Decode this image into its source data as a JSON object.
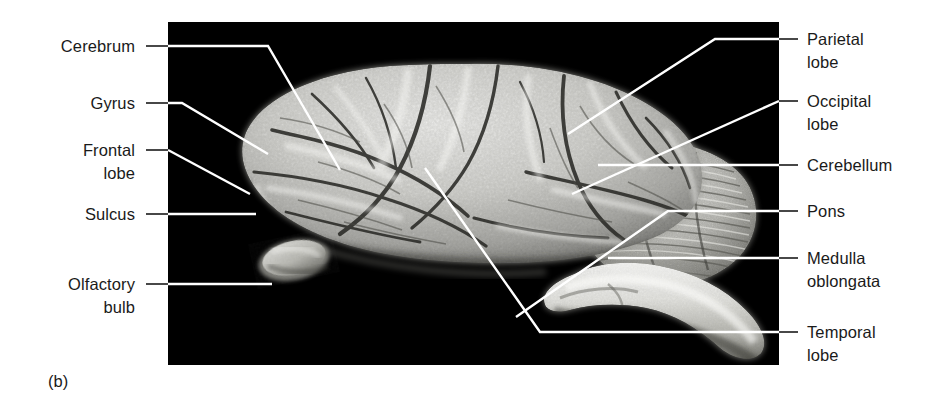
{
  "figure": {
    "caption": "(b)",
    "plate_background": "#000000",
    "label_color": "#1a1a1a",
    "leader_color_on_black": "#ffffff",
    "leader_color_on_white": "#1a1a1a"
  },
  "labels": {
    "left": [
      {
        "id": "cerebrum",
        "text": "Cerebrum"
      },
      {
        "id": "gyrus",
        "text": "Gyrus"
      },
      {
        "id": "frontal-lobe",
        "text": "Frontal\nlobe"
      },
      {
        "id": "sulcus",
        "text": "Sulcus"
      },
      {
        "id": "olfactory-bulb",
        "text": "Olfactory\nbulb"
      }
    ],
    "right": [
      {
        "id": "parietal-lobe",
        "text": "Parietal\nlobe"
      },
      {
        "id": "occipital-lobe",
        "text": "Occipital\nlobe"
      },
      {
        "id": "cerebellum",
        "text": "Cerebellum"
      },
      {
        "id": "pons",
        "text": "Pons"
      },
      {
        "id": "medulla-oblongata",
        "text": "Medulla\noblongata"
      },
      {
        "id": "temporal-lobe",
        "text": "Temporal\nlobe"
      }
    ]
  }
}
